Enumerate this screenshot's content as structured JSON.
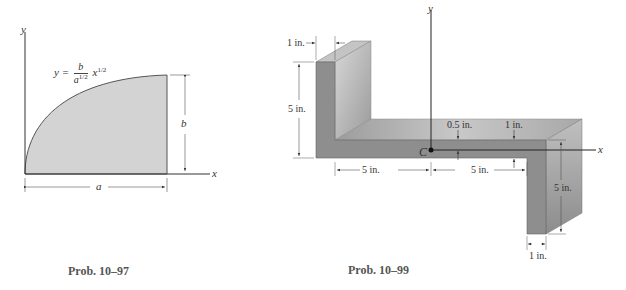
{
  "figures": [
    {
      "id": "left",
      "caption": "Prob. 10–97",
      "axes": {
        "x_label": "x",
        "y_label": "y"
      },
      "equation": {
        "lhs": "y =",
        "numerator": "b",
        "denominator_base": "a",
        "denominator_exp": "1/2",
        "var": "x",
        "var_exp": "1/2"
      },
      "dimensions": {
        "width": "a",
        "height": "b"
      },
      "fill_color": "#d3d3d3"
    },
    {
      "id": "right",
      "caption": "Prob. 10–99",
      "axes": {
        "x_label": "x",
        "y_label": "y"
      },
      "centroid_label": "C",
      "dimensions": {
        "top_flange_thickness": "1 in.",
        "left_flange_height": "5 in.",
        "left_web_length": "5 in.",
        "right_web_length": "5 in.",
        "offset_above_axis": "0.5 in.",
        "web_thickness": "1 in.",
        "right_flange_height": "5 in.",
        "bottom_flange_thickness": "1 in."
      },
      "colors": {
        "front": "#8e8e8e",
        "top": "#b9b9b9",
        "side": "#a6a6a6"
      }
    }
  ]
}
